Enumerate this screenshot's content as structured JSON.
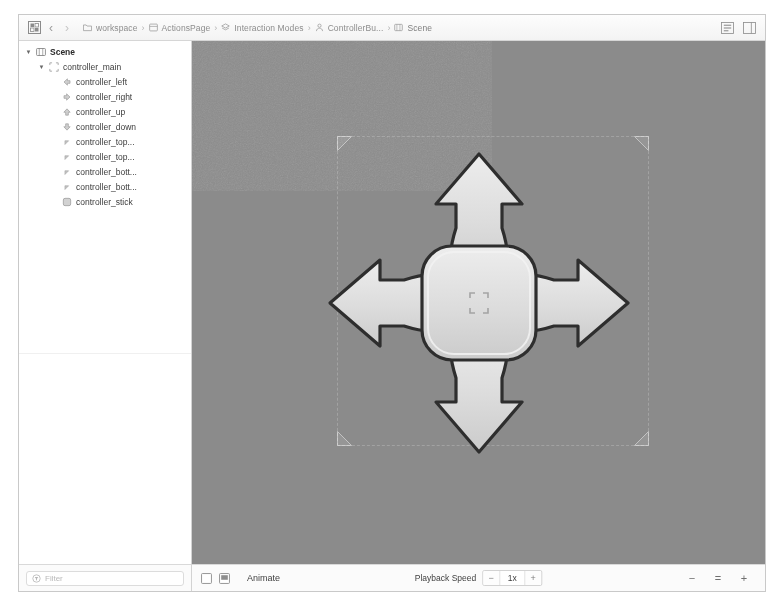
{
  "window": {
    "title": "Scene Editor"
  },
  "topbar": {
    "grid_icon": "grid-icon",
    "back_label": "‹",
    "forward_label": "›",
    "breadcrumb": [
      {
        "icon": "folder-icon",
        "label": "workspace"
      },
      {
        "icon": "package-icon",
        "label": "ActionsPage"
      },
      {
        "icon": "layers-icon",
        "label": "Interaction Modes"
      },
      {
        "icon": "person-icon",
        "label": "ControllerBu..."
      },
      {
        "icon": "scene-icon",
        "label": "Scene"
      }
    ],
    "separator": "›",
    "right_buttons": [
      {
        "name": "inspector-panel-toggle",
        "icon": "panel-list-icon"
      },
      {
        "name": "side-panel-toggle",
        "icon": "panel-split-icon"
      }
    ]
  },
  "sidebar": {
    "tree": [
      {
        "label": "Scene",
        "depth": 0,
        "twisty": "▼",
        "icon": "scene-icon",
        "bold": true
      },
      {
        "label": "controller_main",
        "depth": 1,
        "twisty": "▼",
        "icon": "group-icon",
        "bold": false
      },
      {
        "label": "controller_left",
        "depth": 2,
        "twisty": "",
        "icon": "arrow-left-shape-icon",
        "bold": false
      },
      {
        "label": "controller_right",
        "depth": 2,
        "twisty": "",
        "icon": "arrow-right-shape-icon",
        "bold": false
      },
      {
        "label": "controller_up",
        "depth": 2,
        "twisty": "",
        "icon": "arrow-up-shape-icon",
        "bold": false
      },
      {
        "label": "controller_down",
        "depth": 2,
        "twisty": "",
        "icon": "arrow-down-shape-icon",
        "bold": false
      },
      {
        "label": "controller_top...",
        "depth": 2,
        "twisty": "",
        "icon": "corner-shape-icon",
        "bold": false
      },
      {
        "label": "controller_top...",
        "depth": 2,
        "twisty": "",
        "icon": "corner-shape-icon",
        "bold": false
      },
      {
        "label": "controller_bott...",
        "depth": 2,
        "twisty": "",
        "icon": "corner-shape-icon",
        "bold": false
      },
      {
        "label": "controller_bott...",
        "depth": 2,
        "twisty": "",
        "icon": "corner-shape-icon",
        "bold": false
      },
      {
        "label": "controller_stick",
        "depth": 2,
        "twisty": "",
        "icon": "square-shape-icon",
        "bold": false
      }
    ],
    "filter": {
      "placeholder": "Filter",
      "icon": "filter-circle-icon",
      "value": ""
    }
  },
  "viewport": {
    "background_color": "#8b8b8b",
    "selection": {
      "handle_icon": "corner-handle-icon",
      "x": 145,
      "y": 95,
      "width": 312,
      "height": 310
    },
    "artwork": {
      "name": "dpad-controller",
      "fill_color": "#d7d7d7",
      "stroke_color": "#3a3a3a",
      "highlight_color": "#f4f4f4",
      "parts": [
        "controller_up",
        "controller_down",
        "controller_left",
        "controller_right",
        "controller_stick"
      ]
    }
  },
  "bottombar": {
    "toggles": [
      {
        "name": "frame-toggle",
        "icon": "empty-square-icon"
      },
      {
        "name": "screen-toggle",
        "icon": "screen-icon"
      }
    ],
    "animate_label": "Animate",
    "playback_label": "Playback Speed",
    "speed": {
      "decrease_label": "−",
      "value": "1x",
      "increase_label": "+"
    },
    "zoom": {
      "out_label": "−",
      "fit_label": "=",
      "in_label": "+"
    }
  }
}
